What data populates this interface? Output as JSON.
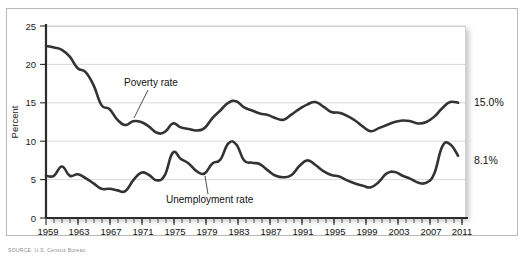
{
  "figure": {
    "source_note": "SOURCE: U.S. Census Bureau"
  },
  "chart_data": {
    "type": "line",
    "title": "",
    "xlabel": "",
    "ylabel": "Percent",
    "ylim": [
      0,
      25
    ],
    "xlim": [
      1959,
      2012
    ],
    "grid": true,
    "gridlines": [
      5,
      10,
      15,
      20,
      25
    ],
    "legend_position": "inline-annotations",
    "yticks": [
      0,
      5,
      10,
      15,
      20,
      25
    ],
    "ytick_labels": [
      "0",
      "5",
      "10",
      "15",
      "20",
      "25"
    ],
    "xticks": [
      1959,
      1963,
      1967,
      1971,
      1975,
      1979,
      1983,
      1987,
      1991,
      1995,
      1999,
      2003,
      2007,
      2011
    ],
    "xtick_labels": [
      "1959",
      "1963",
      "1967",
      "1971",
      "1975",
      "1979",
      "1983",
      "1987",
      "1991",
      "1995",
      "1999",
      "2003",
      "2007",
      "2011"
    ],
    "minor_tick_interval": 1,
    "x": [
      1959,
      1960,
      1961,
      1962,
      1963,
      1964,
      1965,
      1966,
      1967,
      1968,
      1969,
      1970,
      1971,
      1972,
      1973,
      1974,
      1975,
      1976,
      1977,
      1978,
      1979,
      1980,
      1981,
      1982,
      1983,
      1984,
      1985,
      1986,
      1987,
      1988,
      1989,
      1990,
      1991,
      1992,
      1993,
      1994,
      1995,
      1996,
      1997,
      1998,
      1999,
      2000,
      2001,
      2002,
      2003,
      2004,
      2005,
      2006,
      2007,
      2008,
      2009,
      2010,
      2011
    ],
    "series": [
      {
        "name": "Poverty rate",
        "annotation": "Poverty rate",
        "end_label": "15.0%",
        "end_value": 15.0,
        "color": "#333333",
        "values": [
          22.4,
          22.2,
          21.9,
          21.0,
          19.5,
          19.0,
          17.3,
          14.7,
          14.2,
          12.8,
          12.1,
          12.6,
          12.5,
          11.9,
          11.1,
          11.2,
          12.3,
          11.8,
          11.6,
          11.4,
          11.7,
          13.0,
          14.0,
          15.0,
          15.2,
          14.4,
          14.0,
          13.6,
          13.4,
          13.0,
          12.8,
          13.5,
          14.2,
          14.8,
          15.1,
          14.5,
          13.8,
          13.7,
          13.3,
          12.7,
          11.9,
          11.3,
          11.7,
          12.1,
          12.5,
          12.7,
          12.6,
          12.3,
          12.5,
          13.2,
          14.3,
          15.1,
          15.0
        ]
      },
      {
        "name": "Unemployment rate",
        "annotation": "Unemployment  rate",
        "end_label": "8.1%",
        "end_value": 8.1,
        "color": "#333333",
        "values": [
          5.5,
          5.5,
          6.7,
          5.5,
          5.7,
          5.2,
          4.5,
          3.8,
          3.8,
          3.6,
          3.5,
          4.9,
          5.9,
          5.6,
          4.9,
          5.6,
          8.5,
          7.7,
          7.1,
          6.1,
          5.8,
          7.1,
          7.6,
          9.7,
          9.6,
          7.5,
          7.2,
          7.0,
          6.2,
          5.5,
          5.3,
          5.6,
          6.8,
          7.5,
          6.9,
          6.1,
          5.6,
          5.4,
          4.9,
          4.5,
          4.2,
          4.0,
          4.7,
          5.8,
          6.0,
          5.5,
          5.1,
          4.6,
          4.6,
          5.8,
          9.3,
          9.6,
          8.1
        ]
      }
    ],
    "annotations": [
      {
        "text": "Poverty rate",
        "x": 1970.2,
        "y": 17.6
      },
      {
        "text": "Unemployment  rate",
        "x": 1975.0,
        "y": 2.9
      }
    ]
  }
}
